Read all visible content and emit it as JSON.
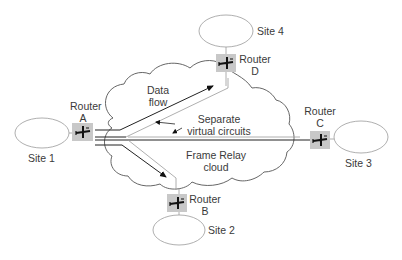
{
  "diagram": {
    "cloud_label": [
      "Frame Relay",
      "cloud"
    ],
    "annotations": {
      "data_flow": [
        "Data",
        "flow"
      ],
      "virtual_circuits": [
        "Separate",
        "virtual circuits"
      ]
    },
    "sites": [
      {
        "id": "site1",
        "label": "Site 1"
      },
      {
        "id": "site2",
        "label": "Site 2"
      },
      {
        "id": "site3",
        "label": "Site 3"
      },
      {
        "id": "site4",
        "label": "Site 4"
      }
    ],
    "routers": [
      {
        "id": "routerA",
        "label": [
          "Router",
          "A"
        ]
      },
      {
        "id": "routerB",
        "label": [
          "Router",
          "B"
        ]
      },
      {
        "id": "routerC",
        "label": [
          "Router",
          "C"
        ]
      },
      {
        "id": "routerD",
        "label": [
          "Router",
          "D"
        ]
      }
    ],
    "connections": [
      {
        "from": "Router A",
        "to": "Router D",
        "type": "virtual circuit"
      },
      {
        "from": "Router A",
        "to": "Router C",
        "type": "virtual circuit"
      },
      {
        "from": "Router A",
        "to": "Router B",
        "type": "virtual circuit"
      }
    ],
    "colors": {
      "line": "#222222",
      "outline": "#555555",
      "light_outline": "#9a9a9a",
      "router_fill": "#c8c8c8",
      "text": "#3a3a3a"
    }
  }
}
